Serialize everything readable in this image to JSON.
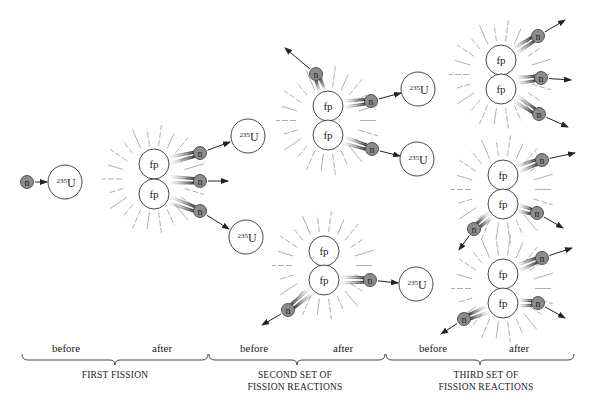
{
  "particles": {
    "neutron": "n",
    "fission_product": "fp",
    "uranium_mass": "235",
    "uranium_symbol": "U"
  },
  "stages": [
    {
      "before": "before",
      "after": "after",
      "caption_lines": [
        "FIRST FISSION"
      ]
    },
    {
      "before": "before",
      "after": "after",
      "caption_lines": [
        "SECOND SET OF",
        "FISSION REACTIONS"
      ]
    },
    {
      "before": "before",
      "after": "after",
      "caption_lines": [
        "THIRD SET OF",
        "FISSION REACTIONS"
      ]
    }
  ],
  "colors": {
    "neutron_fill": "#8c8c8c",
    "line": "#222222",
    "ray": "#999999"
  }
}
